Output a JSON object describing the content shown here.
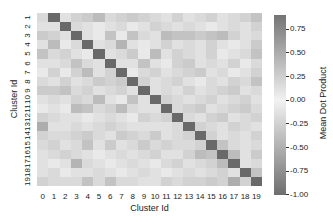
{
  "chart_data": {
    "type": "heatmap",
    "title": "",
    "xlabel": "Cluster Id",
    "ylabel": "Cluster Id",
    "x_categories": [
      "0",
      "1",
      "2",
      "3",
      "4",
      "5",
      "6",
      "7",
      "8",
      "9",
      "10",
      "11",
      "12",
      "13",
      "14",
      "15",
      "16",
      "17",
      "18",
      "19"
    ],
    "y_categories": [
      "1",
      "2",
      "3",
      "4",
      "5",
      "6",
      "7",
      "8",
      "9",
      "10",
      "11",
      "12",
      "13",
      "14",
      "15",
      "16",
      "17",
      "18",
      "19"
    ],
    "colorbar": {
      "label": "Mean Dot Product",
      "range": [
        -1.0,
        0.9
      ],
      "ticks": [
        "0.75",
        "0.50",
        "0.25",
        "0.00",
        "-0.25",
        "-0.50",
        "-0.75",
        "-1.00"
      ],
      "colors": {
        "top": "#747474",
        "mid": "#f2f2f2",
        "bottom": "#6e6e6e"
      }
    },
    "values": [
      [
        0.15,
        0.9,
        0.1,
        0.2,
        0.25,
        0.35,
        0.15,
        0.2,
        0.25,
        0.2,
        0.15,
        0.1,
        0.2,
        0.1,
        0.15,
        0.2,
        0.1,
        0.15,
        0.2,
        0.3
      ],
      [
        0.1,
        0.1,
        0.9,
        0.15,
        0.1,
        0.05,
        0.1,
        0.15,
        0.05,
        0.1,
        0.2,
        0.15,
        0.1,
        0.15,
        0.1,
        0.05,
        0.1,
        0.15,
        0.1,
        0.2
      ],
      [
        0.25,
        0.2,
        0.1,
        0.9,
        0.1,
        0.05,
        0.3,
        0.05,
        0.3,
        0.15,
        0.1,
        0.35,
        0.3,
        0.3,
        0.25,
        0.3,
        0.35,
        0.2,
        0.1,
        0.15
      ],
      [
        0.1,
        0.35,
        0.05,
        0.15,
        0.9,
        0.1,
        0.15,
        0.4,
        0.1,
        0.05,
        0.1,
        0.2,
        0.1,
        0.15,
        0.1,
        0.2,
        0.1,
        0.05,
        0.1,
        0.25
      ],
      [
        0.3,
        0.15,
        0.2,
        0.1,
        0.05,
        0.9,
        0.1,
        0.15,
        0.25,
        0.05,
        0.35,
        0.1,
        0.2,
        0.15,
        0.1,
        0.2,
        0.05,
        0.1,
        0.15,
        0.3
      ],
      [
        0.1,
        0.1,
        0.15,
        0.3,
        0.15,
        0.1,
        0.9,
        0.1,
        0.1,
        0.3,
        0.1,
        0.05,
        0.2,
        0.25,
        0.1,
        0.15,
        0.1,
        0.2,
        0.05,
        0.15
      ],
      [
        0.05,
        0.2,
        0.05,
        0.2,
        0.35,
        0.1,
        0.2,
        0.9,
        0.05,
        0.15,
        0.2,
        0.1,
        0.15,
        0.2,
        0.25,
        0.1,
        0.15,
        0.05,
        0.1,
        0.2
      ],
      [
        0.15,
        0.1,
        0.2,
        0.1,
        0.15,
        0.25,
        0.2,
        0.25,
        0.9,
        0.2,
        0.1,
        0.15,
        0.2,
        0.1,
        0.05,
        0.15,
        0.1,
        0.2,
        0.15,
        0.3
      ],
      [
        0.25,
        0.25,
        0.3,
        0.15,
        0.2,
        0.1,
        0.15,
        0.2,
        0.1,
        0.9,
        0.1,
        0.15,
        0.1,
        0.2,
        0.1,
        0.15,
        0.2,
        0.25,
        0.1,
        0.15
      ],
      [
        0.1,
        0.15,
        0.1,
        0.2,
        0.15,
        0.35,
        0.1,
        0.05,
        0.3,
        0.1,
        0.9,
        0.2,
        0.15,
        0.1,
        0.15,
        0.2,
        0.1,
        0.15,
        0.2,
        0.1
      ],
      [
        0.05,
        0.1,
        0.05,
        0.35,
        0.3,
        0.15,
        0.2,
        0.35,
        0.15,
        0.1,
        0.1,
        0.9,
        0.15,
        0.2,
        0.25,
        0.1,
        0.15,
        0.2,
        0.25,
        0.15
      ],
      [
        0.2,
        0.15,
        0.1,
        0.1,
        0.05,
        0.1,
        0.15,
        0.1,
        0.05,
        0.2,
        0.15,
        0.2,
        0.9,
        0.15,
        0.1,
        0.2,
        0.25,
        0.1,
        0.15,
        0.2
      ],
      [
        0.45,
        0.1,
        0.1,
        0.15,
        0.1,
        0.15,
        0.2,
        0.15,
        0.1,
        0.1,
        0.1,
        0.1,
        0.15,
        0.9,
        0.2,
        0.15,
        0.1,
        0.2,
        0.15,
        0.1
      ],
      [
        0.2,
        0.15,
        0.15,
        0.2,
        0.25,
        0.15,
        0.1,
        0.25,
        0.2,
        0.15,
        0.25,
        0.1,
        0.15,
        0.2,
        0.9,
        0.2,
        0.1,
        0.15,
        0.1,
        0.2
      ],
      [
        0.15,
        0.2,
        0.1,
        0.15,
        0.3,
        0.1,
        0.25,
        0.1,
        0.15,
        0.25,
        0.15,
        0.2,
        0.15,
        0.15,
        0.2,
        0.9,
        0.3,
        0.15,
        0.1,
        0.15
      ],
      [
        0.1,
        0.15,
        0.2,
        0.15,
        0.1,
        0.05,
        0.1,
        0.15,
        0.1,
        0.15,
        0.2,
        0.1,
        0.1,
        0.2,
        0.35,
        0.3,
        0.9,
        0.35,
        0.1,
        0.25
      ],
      [
        0.1,
        0.05,
        0.1,
        0.4,
        0.15,
        0.1,
        0.05,
        0.1,
        0.15,
        0.1,
        0.05,
        0.15,
        0.2,
        0.1,
        0.15,
        0.2,
        0.35,
        0.9,
        0.1,
        0.15
      ],
      [
        0.1,
        0.15,
        0.05,
        0.1,
        0.1,
        0.15,
        0.1,
        0.05,
        0.1,
        0.15,
        0.1,
        0.05,
        0.1,
        0.15,
        0.1,
        0.15,
        0.2,
        0.1,
        0.9,
        0.3
      ],
      [
        0.2,
        0.15,
        0.15,
        0.15,
        0.3,
        0.15,
        0.3,
        0.15,
        0.15,
        0.1,
        0.1,
        0.2,
        0.15,
        0.2,
        0.2,
        0.25,
        0.2,
        0.45,
        0.2,
        0.9
      ]
    ]
  },
  "axes": {
    "xlabel": "Cluster Id",
    "ylabel": "Cluster Id",
    "cblabel": "Mean Dot Product"
  }
}
